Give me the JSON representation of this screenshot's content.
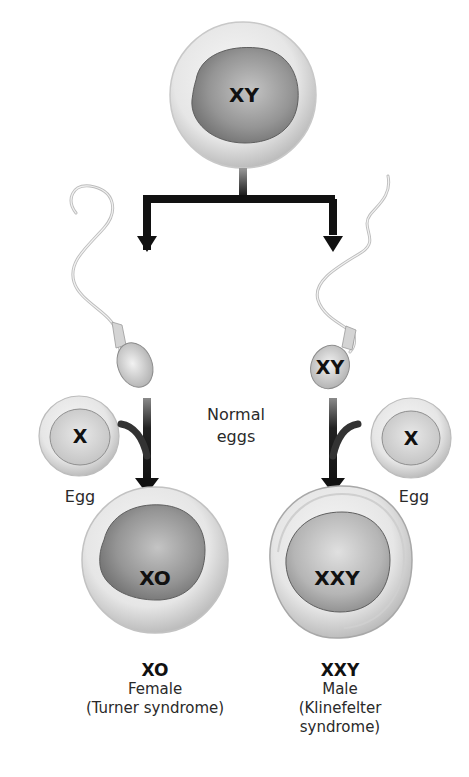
{
  "diagram": {
    "parent_cell": {
      "label": "XY"
    },
    "sperm_left": {
      "label": ""
    },
    "sperm_right": {
      "label": "XY"
    },
    "egg_left": {
      "label": "X",
      "caption": "Egg"
    },
    "egg_right": {
      "label": "X",
      "caption": "Egg"
    },
    "center_note": {
      "line1": "Normal",
      "line2": "eggs"
    },
    "zygote_left": {
      "label": "XO",
      "result_title": "XO",
      "result_line1": "Female",
      "result_line2": "(Turner syndrome)"
    },
    "zygote_right": {
      "label": "XXY",
      "result_title": "XXY",
      "result_line1": "Male",
      "result_line2": "(Klinefelter",
      "result_line3": "syndrome)"
    },
    "colors": {
      "arrow": "#111111",
      "cell_outer": "#e4e4e4",
      "nucleus_dark": "#7a7a7a",
      "nucleus_light": "#bdbdbd",
      "egg_nucleus": "#d0d0d0"
    }
  }
}
